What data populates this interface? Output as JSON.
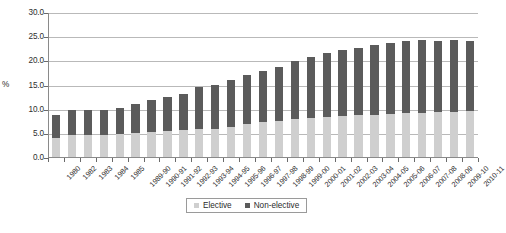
{
  "chart_data": {
    "type": "bar",
    "stacked": true,
    "title": "",
    "subtitle": "",
    "xlabel": "",
    "ylabel": "%",
    "ylim": [
      0.0,
      30.0
    ],
    "ytick_step": 5.0,
    "ytick_labels": [
      "30.0",
      "25.0",
      "20.0",
      "15.0",
      "10.0",
      "5.0",
      "0.0"
    ],
    "ytick_values": [
      30.0,
      25.0,
      20.0,
      15.0,
      10.0,
      5.0,
      0.0
    ],
    "grid": true,
    "legend_position": "bottom-center",
    "categories": [
      "1980",
      "1982",
      "1983",
      "1984",
      "1985",
      "1989-90",
      "1990-91",
      "1991-92",
      "1992-93",
      "1993-94",
      "1994-95",
      "1995-96",
      "1996-97",
      "1997-98",
      "1998-99",
      "1999-00",
      "2000-01",
      "2001-02",
      "2002-03",
      "2003-04",
      "2004-05",
      "2005-06",
      "2006-07",
      "2007-08",
      "2008-09",
      "2009-10",
      "2010-11"
    ],
    "series": [
      {
        "name": "Elective",
        "color": "#cfcfcf",
        "values": [
          4.2,
          4.8,
          4.8,
          4.8,
          4.9,
          5.2,
          5.4,
          5.5,
          5.7,
          5.9,
          6.0,
          6.4,
          7.0,
          7.4,
          7.6,
          8.0,
          8.3,
          8.5,
          8.7,
          8.8,
          9.0,
          9.1,
          9.3,
          9.4,
          9.5,
          9.6,
          9.7
        ]
      },
      {
        "name": "Non-elective",
        "color": "#5b5b5b",
        "values": [
          4.6,
          5.1,
          5.1,
          5.1,
          5.4,
          5.9,
          6.7,
          7.1,
          7.6,
          8.7,
          9.2,
          9.7,
          10.1,
          10.6,
          11.2,
          12.0,
          12.7,
          13.2,
          13.7,
          14.0,
          14.3,
          14.7,
          14.9,
          15.1,
          14.8,
          14.8,
          14.6
        ]
      }
    ],
    "totals": [
      8.8,
      9.9,
      9.9,
      9.9,
      10.3,
      11.1,
      12.1,
      12.6,
      13.3,
      14.6,
      15.2,
      16.1,
      17.1,
      18.0,
      18.8,
      20.0,
      21.0,
      21.7,
      22.4,
      22.8,
      23.3,
      23.8,
      24.2,
      24.5,
      24.3,
      24.4,
      24.3
    ]
  },
  "legend": {
    "items": [
      {
        "label": "Elective"
      },
      {
        "label": "Non-elective"
      }
    ]
  },
  "caption": {
    "text": ""
  }
}
